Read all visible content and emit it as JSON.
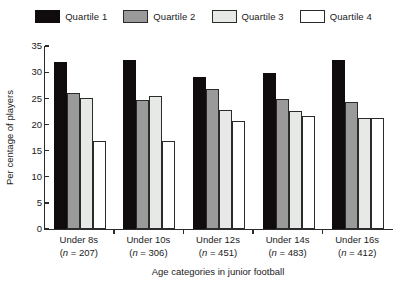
{
  "legend": {
    "position": "top-center",
    "entries": [
      {
        "label": "Quartile 1",
        "color": "#100c0e"
      },
      {
        "label": "Quartile 2",
        "color": "#9a9a9a"
      },
      {
        "label": "Quartile 3",
        "color": "#e7e9e7"
      },
      {
        "label": "Quartile 4",
        "color": "#ffffff"
      }
    ]
  },
  "axes": {
    "y_title": "Per centage of players",
    "x_title": "Age categories in junior football",
    "y_ticks": [
      "0",
      "5",
      "10",
      "15",
      "20",
      "25",
      "30",
      "35"
    ]
  },
  "categories": [
    {
      "name": "Under 8s",
      "n_text": "(n = 207)",
      "n": 207
    },
    {
      "name": "Under 10s",
      "n_text": "(n = 306)",
      "n": 306
    },
    {
      "name": "Under 12s",
      "n_text": "(n = 451)",
      "n": 451
    },
    {
      "name": "Under 14s",
      "n_text": "(n = 483)",
      "n": 483
    },
    {
      "name": "Under 16s",
      "n_text": "(n = 412)",
      "n": 412
    }
  ],
  "chart_data": {
    "type": "bar",
    "title": "",
    "xlabel": "Age categories in junior football",
    "ylabel": "Per centage of players",
    "ylim": [
      0,
      35
    ],
    "ytick_step": 5,
    "grid": false,
    "legend_position": "top-center",
    "categories": [
      "Under 8s",
      "Under 10s",
      "Under 12s",
      "Under 14s",
      "Under 16s"
    ],
    "category_n": [
      207,
      306,
      451,
      483,
      412
    ],
    "series": [
      {
        "name": "Quartile 1",
        "color": "#100c0e",
        "values": [
          32.0,
          32.4,
          29.0,
          29.8,
          32.4
        ]
      },
      {
        "name": "Quartile 2",
        "color": "#9a9a9a",
        "values": [
          26.0,
          24.6,
          26.8,
          24.8,
          24.2
        ]
      },
      {
        "name": "Quartile 3",
        "color": "#e7e9e7",
        "values": [
          25.0,
          25.4,
          22.7,
          22.6,
          21.2
        ]
      },
      {
        "name": "Quartile 4",
        "color": "#ffffff",
        "values": [
          16.8,
          16.8,
          20.7,
          21.7,
          21.3
        ]
      }
    ]
  }
}
